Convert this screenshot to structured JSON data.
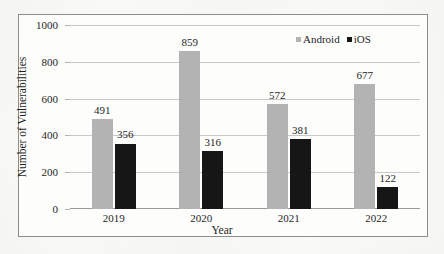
{
  "chart_data": {
    "type": "bar",
    "title": "",
    "xlabel": "Year",
    "ylabel": "Number of Vulnerabilities",
    "categories": [
      "2019",
      "2020",
      "2021",
      "2022"
    ],
    "series": [
      {
        "name": "Android",
        "color": "#b3b3b3",
        "values": [
          491,
          859,
          572,
          677
        ]
      },
      {
        "name": "iOS",
        "color": "#161616",
        "values": [
          356,
          316,
          381,
          122
        ]
      }
    ],
    "ylim": [
      0,
      1000
    ],
    "yticks": [
      0,
      200,
      400,
      600,
      800,
      1000
    ],
    "ytick_labels": [
      "0",
      "200",
      "400",
      "600",
      "800",
      "1000"
    ],
    "grid": true,
    "legend_position": "top-right",
    "data_labels": [
      "491",
      "356",
      "859",
      "316",
      "572",
      "381",
      "677",
      "122"
    ]
  },
  "legend": {
    "entries": [
      {
        "label": "Android",
        "marker": "square-gray"
      },
      {
        "label": "iOS",
        "marker": "square-black"
      }
    ]
  },
  "colors": {
    "android": "#b3b3b3",
    "ios": "#161616",
    "gridline": "#c8c8c8",
    "frame": "#8d8d8d",
    "text": "#1f1f1f",
    "background": "#fbfbfa"
  }
}
